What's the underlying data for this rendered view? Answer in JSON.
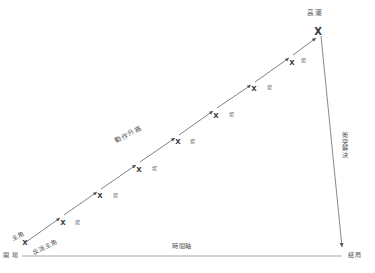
{
  "diagram": {
    "type": "story-structure-plot",
    "background_color": "#ffffff",
    "line_color": "#5a5a5a",
    "axis_color": "#9a9a9a",
    "text_color": "#545454",
    "labels": {
      "protagonist": "主角",
      "antagonist": "反派主角",
      "rising_action": "動作升高",
      "climax": "高潮",
      "conflict_resolution": "衝突解決",
      "opening": "開 場",
      "ending": "結局",
      "time_axis": "時間軸"
    },
    "scene_label": "場",
    "scene_markers": [
      {
        "id": 1,
        "x": 25,
        "y": 243,
        "marker": "X",
        "size": "small"
      },
      {
        "id": 2,
        "x": 63,
        "y": 223,
        "marker": "X",
        "size": "small"
      },
      {
        "id": 3,
        "x": 100,
        "y": 196,
        "marker": "X",
        "size": "small"
      },
      {
        "id": 4,
        "x": 139,
        "y": 170,
        "marker": "X",
        "size": "small"
      },
      {
        "id": 5,
        "x": 178,
        "y": 142,
        "marker": "X",
        "size": "small"
      },
      {
        "id": 6,
        "x": 216,
        "y": 116,
        "marker": "X",
        "size": "small"
      },
      {
        "id": 7,
        "x": 254,
        "y": 89,
        "marker": "X",
        "size": "small"
      },
      {
        "id": 8,
        "x": 292,
        "y": 63,
        "marker": "X",
        "size": "small"
      },
      {
        "id": 9,
        "x": 318,
        "y": 31,
        "marker": "X",
        "size": "large"
      }
    ],
    "scene_labels": [
      {
        "x": 77,
        "y": 221
      },
      {
        "x": 115,
        "y": 194
      },
      {
        "x": 154,
        "y": 167
      },
      {
        "x": 192,
        "y": 140
      },
      {
        "x": 231,
        "y": 113
      },
      {
        "x": 269,
        "y": 86
      },
      {
        "x": 303,
        "y": 59
      }
    ],
    "axis": {
      "x_start": 22,
      "x_end": 342,
      "y": 256
    },
    "rising_line": {
      "x1": 25,
      "y1": 243,
      "x2": 320,
      "y2": 33
    },
    "falling_line": {
      "x1": 321,
      "y1": 35,
      "x2": 343,
      "y2": 248
    }
  }
}
